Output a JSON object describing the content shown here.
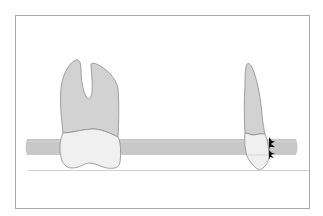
{
  "diagram": {
    "title": "",
    "colors": {
      "background": "#ffffff",
      "frame": "#a8a8a8",
      "root_fill": "#d2d2d2",
      "crown_fill": "#f0f0f0",
      "outline": "#8c8c8c",
      "band_fill": "#c8c8c8",
      "baseline": "#c4c4c4",
      "marker": "#111111"
    },
    "elements": [
      {
        "id": "frame",
        "label": ""
      },
      {
        "id": "band",
        "label": ""
      },
      {
        "id": "baseline",
        "label": ""
      },
      {
        "id": "tooth-two-root",
        "label": ""
      },
      {
        "id": "tooth-single-root",
        "label": ""
      },
      {
        "id": "contact-markers",
        "label": "",
        "count": 2
      }
    ]
  }
}
